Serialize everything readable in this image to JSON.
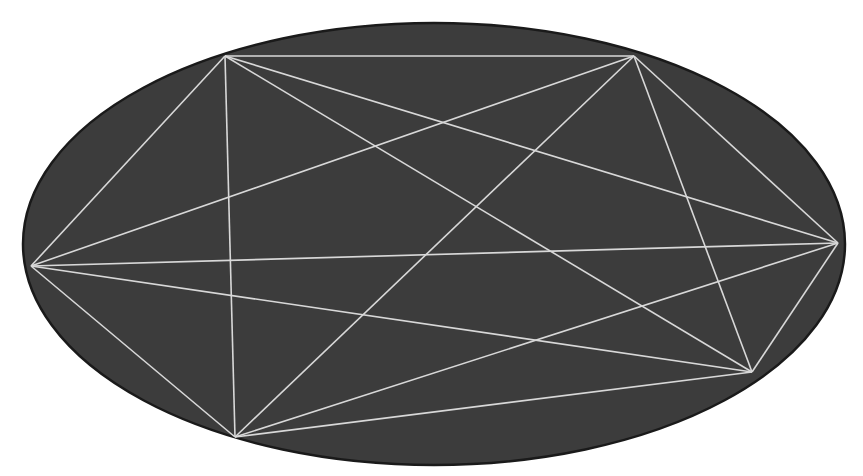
{
  "diagram": {
    "type": "complete-graph-in-ellipse",
    "colors": {
      "background": "#ffffff",
      "ellipse_fill": "#3c3c3c",
      "ellipse_stroke": "#1a1a1a",
      "edge": "#d8d8d8"
    },
    "ellipse": {
      "cx": 434,
      "cy": 244,
      "rx": 411,
      "ry": 221
    },
    "vertices": [
      {
        "id": "A",
        "x": 225,
        "y": 56
      },
      {
        "id": "B",
        "x": 634,
        "y": 56
      },
      {
        "id": "C",
        "x": 31,
        "y": 266
      },
      {
        "id": "D",
        "x": 838,
        "y": 243
      },
      {
        "id": "E",
        "x": 235,
        "y": 437
      },
      {
        "id": "F",
        "x": 752,
        "y": 372
      }
    ],
    "edges": [
      [
        "A",
        "B"
      ],
      [
        "A",
        "C"
      ],
      [
        "A",
        "D"
      ],
      [
        "A",
        "E"
      ],
      [
        "A",
        "F"
      ],
      [
        "B",
        "C"
      ],
      [
        "B",
        "D"
      ],
      [
        "B",
        "E"
      ],
      [
        "B",
        "F"
      ],
      [
        "C",
        "D"
      ],
      [
        "C",
        "E"
      ],
      [
        "C",
        "F"
      ],
      [
        "D",
        "E"
      ],
      [
        "D",
        "F"
      ],
      [
        "E",
        "F"
      ]
    ]
  }
}
